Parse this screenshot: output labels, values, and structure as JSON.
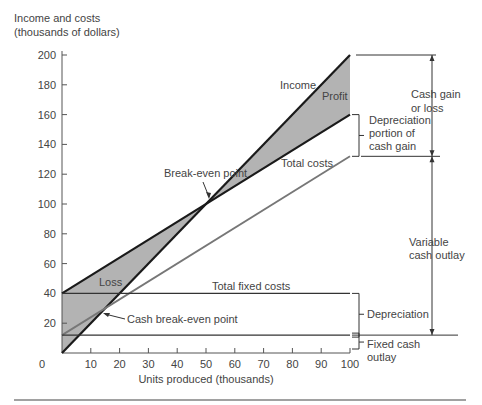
{
  "chart_data": {
    "type": "line",
    "title": "",
    "ylabel_line1": "Income and costs",
    "ylabel_line2": "(thousands of dollars)",
    "xlabel": "Units produced (thousands)",
    "xlim": [
      0,
      100
    ],
    "ylim": [
      0,
      200
    ],
    "x_ticks": [
      0,
      10,
      20,
      30,
      40,
      50,
      60,
      70,
      80,
      90,
      100
    ],
    "y_ticks": [
      20,
      40,
      60,
      80,
      100,
      120,
      140,
      160,
      180,
      200
    ],
    "series": [
      {
        "name": "Income",
        "x": [
          0,
          100
        ],
        "values": [
          0,
          200
        ],
        "color": "#1a1a1a"
      },
      {
        "name": "Total costs",
        "x": [
          0,
          100
        ],
        "values": [
          40,
          160
        ],
        "color": "#1a1a1a"
      },
      {
        "name": "Cash costs (variable + fixed cash)",
        "x": [
          0,
          100
        ],
        "values": [
          12,
          132
        ],
        "color": "#777777"
      },
      {
        "name": "Total fixed costs",
        "x": [
          0,
          100
        ],
        "values": [
          40,
          40
        ],
        "color": "#333333"
      },
      {
        "name": "Fixed cash outlay",
        "x": [
          0,
          100
        ],
        "values": [
          12,
          12
        ],
        "color": "#333333"
      }
    ],
    "regions": [
      {
        "name": "Loss",
        "between": [
          "Total costs",
          "Income"
        ],
        "x_range": [
          0,
          50
        ]
      },
      {
        "name": "Profit",
        "between": [
          "Income",
          "Total costs"
        ],
        "x_range": [
          50,
          100
        ]
      }
    ],
    "points": [
      {
        "name": "Break-even point",
        "x": 50,
        "y": 100
      },
      {
        "name": "Cash break-even point",
        "x": 13,
        "y": 27
      }
    ],
    "right_annotations": [
      {
        "name": "Cash gain or loss",
        "from": 132,
        "to": 200
      },
      {
        "name": "Depreciation portion of cash gain",
        "from": 132,
        "to": 160
      },
      {
        "name": "Variable cash outlay",
        "from": 12,
        "to": 132
      },
      {
        "name": "Depreciation",
        "from": 12,
        "to": 40
      },
      {
        "name": "Fixed cash outlay",
        "from": 0,
        "to": 12
      }
    ]
  },
  "labels": {
    "income": "Income",
    "profit": "Profit",
    "total_costs": "Total costs",
    "break_even": "Break-even point",
    "loss": "Loss",
    "total_fixed_costs": "Total fixed costs",
    "cash_break_even": "Cash break-even point",
    "cash_gain_1": "Cash gain",
    "cash_gain_2": "or loss",
    "dep_portion_1": "Depreciation",
    "dep_portion_2": "portion of",
    "dep_portion_3": "cash gain",
    "variable_1": "Variable",
    "variable_2": "cash outlay",
    "depreciation": "Depreciation",
    "fixed_cash_1": "Fixed cash",
    "fixed_cash_2": "outlay"
  },
  "colors": {
    "shade": "#b3b3b3",
    "dark_line": "#1a1a1a",
    "gray_line": "#7a7a7a",
    "axis": "#555555"
  }
}
